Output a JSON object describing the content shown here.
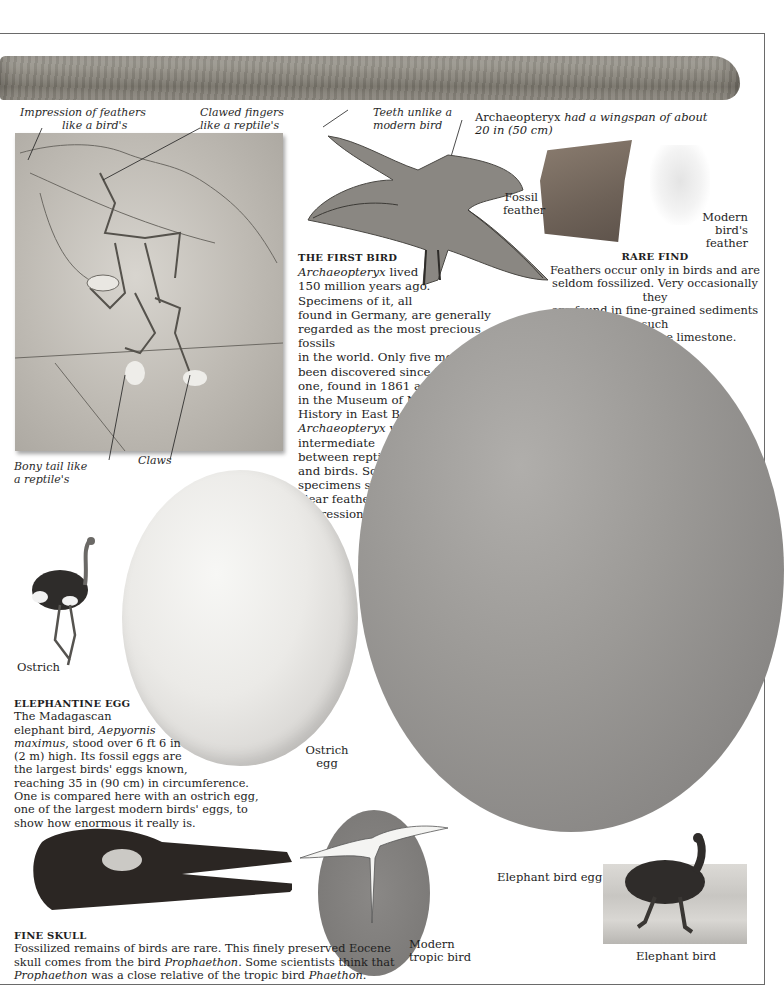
{
  "page": {
    "frame_color": "#6a6a6a",
    "background": "#ffffff"
  },
  "archaeopteryx_fossil": {
    "labels": {
      "feathers_impression": [
        "Impression of feathers",
        "like a bird's"
      ],
      "clawed_fingers": [
        "Clawed fingers",
        "like a reptile's"
      ],
      "bony_tail": [
        "Bony tail like",
        "a reptile's"
      ],
      "claws": "Claws"
    }
  },
  "archaeopteryx_model": {
    "labels": {
      "teeth": [
        "Teeth unlike a",
        "modern bird"
      ],
      "wingspan_name": "Archaeopteryx",
      "wingspan_rest": " had a wingspan of about",
      "wingspan_line2": "20 in (50 cm)"
    }
  },
  "first_bird": {
    "heading": "THE FIRST BIRD",
    "lines": [
      {
        "italic": "Archaeopteryx",
        "text": " lived"
      },
      {
        "text": "150 million years ago."
      },
      {
        "text": "Specimens of it, all"
      },
      {
        "text": "found in Germany, are generally"
      },
      {
        "text": "regarded as the most precious fossils"
      },
      {
        "text": "in the world. Only five more have"
      },
      {
        "text": "been discovered since this first"
      },
      {
        "text": "one, found in 1861 and now"
      },
      {
        "text": "in the Museum of Natural"
      },
      {
        "text": "History in East Berlin."
      },
      {
        "italic": "Archaeopteryx",
        "text": " was"
      },
      {
        "text": "intermediate"
      },
      {
        "text": "between reptiles"
      },
      {
        "text": "and birds. Some"
      },
      {
        "text": "specimens show"
      },
      {
        "text": "clear feather"
      },
      {
        "text": "impressions."
      }
    ]
  },
  "feathers": {
    "fossil_label": [
      "Fossil",
      "feather"
    ],
    "modern_label": [
      "Modern",
      "bird's",
      "feather"
    ],
    "heading": "RARE FIND",
    "lines": [
      "Feathers occur only in birds and are",
      "seldom fossilized. Very occasionally they",
      "are found in fine-grained sediments such",
      "as this Oligocene limestone."
    ]
  },
  "elephantine_egg": {
    "heading": "ELEPHANTINE EGG",
    "lines": [
      {
        "text": "The Madagascan"
      },
      {
        "text": "elephant bird, ",
        "italic": "Aepyornis"
      },
      {
        "italic": "maximus",
        "text": ", stood over 6 ft 6 in"
      },
      {
        "text": "(2 m) high. Its fossil eggs are"
      },
      {
        "text": "the largest birds' eggs known,"
      },
      {
        "text": "reaching 35 in (90 cm) in circumference."
      },
      {
        "text": "One is compared here with an ostrich egg,"
      },
      {
        "text": "one of the largest modern birds' eggs, to"
      },
      {
        "text": "show how enormous it really is."
      }
    ],
    "ostrich_label": "Ostrich",
    "ostrich_egg_label": [
      "Ostrich",
      "egg"
    ],
    "elephant_bird_egg_label": "Elephant bird egg",
    "elephant_bird_label": "Elephant bird",
    "tropic_bird_label": [
      "Modern",
      "tropic bird"
    ]
  },
  "fine_skull": {
    "heading": "FINE SKULL",
    "line1": "Fossilized remains of birds are rare. This finely preserved Eocene",
    "line2_a": "skull comes from the bird ",
    "line2_it": "Prophaethon",
    "line2_b": ". Some scientists think that",
    "line3_it": "Prophaethon",
    "line3_b": " was a close relative of the tropic bird ",
    "line3_it2": "Phaethon",
    "line3_c": "."
  }
}
